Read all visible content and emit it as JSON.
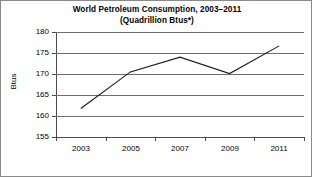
{
  "chart_data": {
    "type": "line",
    "title": "World Petroleum Consumption, 2003–2011",
    "subtitle": "(Quadrillion Btus*)",
    "title_lines": [
      "World Petroleum Consumption, 2003–2011",
      "(Quadrillion Btus*)"
    ],
    "xlabel": "",
    "ylabel": "Btus",
    "categories": [
      "2003",
      "2005",
      "2007",
      "2009",
      "2011"
    ],
    "x": [
      2003,
      2005,
      2007,
      2009,
      2011
    ],
    "values": [
      161.8,
      170.5,
      174.0,
      170.1,
      176.7
    ],
    "series": [
      {
        "name": "World Petroleum Consumption",
        "values": [
          161.8,
          170.5,
          174.0,
          170.1,
          176.7
        ]
      }
    ],
    "ylim": [
      155,
      180
    ],
    "yticks": [
      155,
      160,
      165,
      170,
      175,
      180
    ],
    "ytick_labels": [
      "155",
      "160",
      "165",
      "170",
      "175",
      "180"
    ],
    "xtick_labels": [
      "2003",
      "2005",
      "2007",
      "2009",
      "2011"
    ],
    "grid": "horizontal",
    "legend": "none",
    "line_color": "#1a1a1a",
    "grid_color": "#6e6e6e",
    "axis_color": "#4a4a4a",
    "background_color": "#ffffff",
    "border_color": "#8a8a8a",
    "annotations": []
  }
}
